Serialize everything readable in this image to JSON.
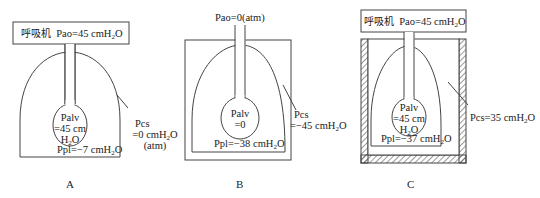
{
  "panels": [
    {
      "id": "A",
      "caption": "A",
      "ventilator": {
        "label": "呼吸机",
        "pao": "Pao=45 cmH",
        "pao_sub": "2",
        "pao_tail": "O"
      },
      "palv": {
        "line1": "Palv",
        "line2": "=45 cm",
        "line3": "H",
        "line3_sub": "2",
        "line3_tail": "O"
      },
      "ppl": {
        "text": "Ppl=−7 cmH",
        "sub": "2",
        "tail": "O"
      },
      "pcs": {
        "line1": "Pcs",
        "line2": "=0 cmH",
        "line2_sub": "2",
        "line2_tail": "O",
        "line3": "(atm)"
      }
    },
    {
      "id": "B",
      "caption": "B",
      "pao": "Pao=0(atm)",
      "palv": {
        "line1": "Palv",
        "line2": "=0"
      },
      "ppl": {
        "text": "Ppl=−38 cmH",
        "sub": "2",
        "tail": "O"
      },
      "pcs": {
        "line1": "Pcs",
        "line2": "=−45 cmH",
        "line2_sub": "2",
        "line2_tail": "O"
      }
    },
    {
      "id": "C",
      "caption": "C",
      "ventilator": {
        "label": "呼吸机",
        "pao": "Pao=45 cmH",
        "pao_sub": "2",
        "pao_tail": "O"
      },
      "palv": {
        "line1": "Palv",
        "line2": "=45 cm",
        "line3": "H",
        "line3_sub": "2",
        "line3_tail": "O"
      },
      "ppl": {
        "text": "Ppl=−37 cmH",
        "sub": "2",
        "tail": "O"
      },
      "pcs": {
        "text": "Pcs=35 cmH",
        "sub": "2",
        "tail": "O"
      }
    }
  ],
  "colors": {
    "stroke": "#444444",
    "hatch": "#555555",
    "background": "#ffffff"
  }
}
